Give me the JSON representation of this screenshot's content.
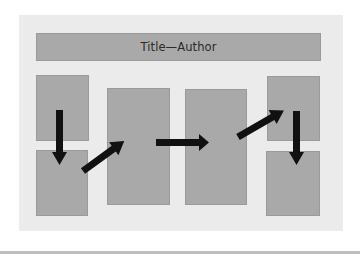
{
  "diagram": {
    "title": "Title—Author",
    "colors": {
      "background": "#ffffff",
      "panel": "#ebebeb",
      "box": "#a9a9a9",
      "arrow": "#111111",
      "bottom_strip": "#bdbdbd"
    },
    "boxes": [
      {
        "id": "col1-top",
        "column": 1,
        "position": "top"
      },
      {
        "id": "col1-bottom",
        "column": 1,
        "position": "bottom"
      },
      {
        "id": "col2",
        "column": 2,
        "position": "tall"
      },
      {
        "id": "col3",
        "column": 3,
        "position": "tall"
      },
      {
        "id": "col4-top",
        "column": 4,
        "position": "top"
      },
      {
        "id": "col4-bottom",
        "column": 4,
        "position": "bottom"
      }
    ],
    "arrows": [
      {
        "from": "col1-top",
        "to": "col1-bottom",
        "direction": "down"
      },
      {
        "from": "col1-bottom",
        "to": "col2",
        "direction": "up-right"
      },
      {
        "from": "col2",
        "to": "col3",
        "direction": "right"
      },
      {
        "from": "col3",
        "to": "col4-top",
        "direction": "up-right"
      },
      {
        "from": "col4-top",
        "to": "col4-bottom",
        "direction": "down"
      }
    ]
  }
}
